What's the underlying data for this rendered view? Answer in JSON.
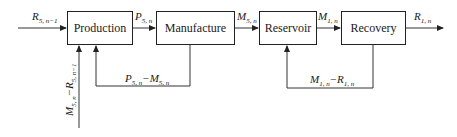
{
  "diagram": {
    "blocks": [
      {
        "id": "production",
        "label": "Production"
      },
      {
        "id": "manufacture",
        "label": "Manufacture"
      },
      {
        "id": "reservoir",
        "label": "Reservoir"
      },
      {
        "id": "recovery",
        "label": "Recovery"
      }
    ],
    "signals": {
      "input": {
        "base": "R",
        "sub": "5, n−1"
      },
      "prod_to_manu": {
        "base": "P",
        "sub": "5, n"
      },
      "manu_to_res": {
        "base": "M",
        "sub": "5, n"
      },
      "res_to_rec": {
        "base": "M",
        "sub": "1, n"
      },
      "output": {
        "base": "R",
        "sub": "1, n"
      },
      "feedback_manu": {
        "a": "P",
        "a_sub": "5, n",
        "op": "−",
        "b": "M",
        "b_sub": "5, n"
      },
      "feedback_rec": {
        "a": "M",
        "a_sub": "1, n",
        "op": "−",
        "b": "R",
        "b_sub": "1, n"
      },
      "vertical_input": {
        "a": "M",
        "a_sub": "5, n",
        "op": "−",
        "b": "R",
        "b_sub": "5, n−1"
      }
    }
  }
}
